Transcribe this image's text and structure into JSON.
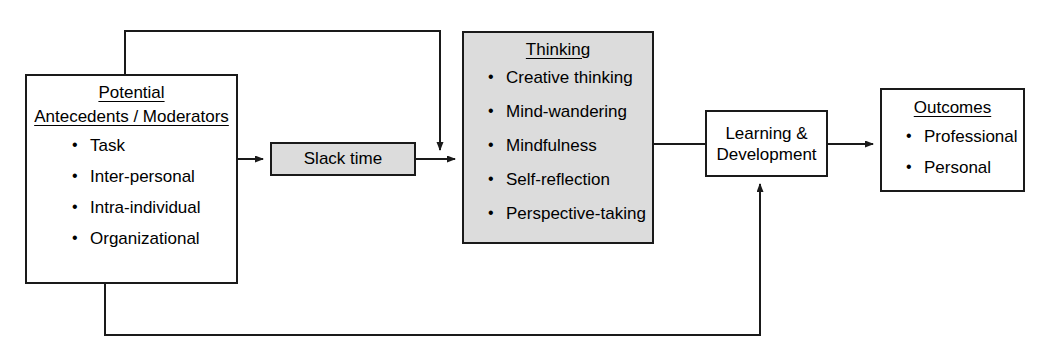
{
  "diagram": {
    "kind": "process-flow-diagram",
    "colors": {
      "line": "#1a1a1a",
      "box_border": "#1a1a1a",
      "box_fill": "#ffffff",
      "shaded_fill": "#dcdcdc",
      "background": "#ffffff",
      "text": "#000000"
    },
    "nodes": {
      "potential": {
        "title": "Potential",
        "subtitle": "Antecedents / Moderators",
        "bullets": [
          "Task",
          "Inter-personal",
          "Intra-individual",
          "Organizational"
        ]
      },
      "slack": {
        "label": "Slack time"
      },
      "thinking": {
        "title": "Thinking",
        "bullets": [
          "Creative thinking",
          "Mind-wandering",
          "Mindfulness",
          "Self-reflection",
          "Perspective-taking"
        ]
      },
      "learning": {
        "label": "Learning & Development"
      },
      "outcomes": {
        "title": "Outcomes",
        "bullets": [
          "Professional",
          "Personal"
        ]
      }
    },
    "edges": [
      {
        "id": "potential-to-slack",
        "from": "potential",
        "to": "slack",
        "arrow": true
      },
      {
        "id": "slack-to-thinking",
        "from": "slack",
        "to": "thinking",
        "arrow": true
      },
      {
        "id": "potential-top-feedback",
        "from": "potential",
        "to": "slack-to-thinking-junction",
        "arrow": true
      },
      {
        "id": "thinking-to-learning",
        "from": "thinking",
        "to": "learning",
        "arrow": false
      },
      {
        "id": "learning-to-outcomes",
        "from": "learning",
        "to": "outcomes",
        "arrow": true
      },
      {
        "id": "potential-bottom-feedback",
        "from": "potential",
        "to": "learning",
        "arrow": true
      }
    ]
  }
}
